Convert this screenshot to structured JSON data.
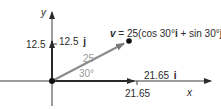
{
  "diagram": {
    "type": "vector-decomposition",
    "axes": {
      "x_label": "x",
      "y_label": "y"
    },
    "vector": {
      "magnitude_label": "25",
      "angle_label": "30°",
      "name": "v",
      "equation_rest": " = 25(cos 30°",
      "i_unit": "i",
      "plus_sin": " + sin 30°",
      "j_unit": "j",
      "close": ")"
    },
    "x_component": {
      "label_value": "21.65",
      "unit": "i",
      "tick_label": "21.65"
    },
    "y_component": {
      "label_value": "12.5",
      "unit": "j",
      "tick_label": "12.5"
    },
    "colors": {
      "axis": "#2a2a2a",
      "vector": "#8a8a8a",
      "component": "#2a2a2a",
      "angle_label": "#9a9a9a"
    }
  }
}
